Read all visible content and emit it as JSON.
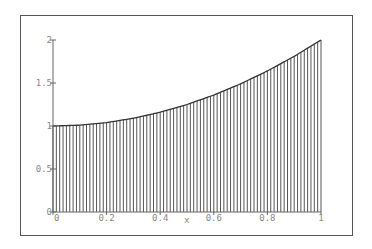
{
  "chart_data": {
    "type": "area",
    "title": "",
    "xlabel": "x",
    "ylabel": "",
    "function": "1 + x^2",
    "fill_style": "vertical-hatch",
    "x": [
      0,
      0.1,
      0.2,
      0.3,
      0.4,
      0.5,
      0.6,
      0.7,
      0.8,
      0.9,
      1.0
    ],
    "values": [
      1.0,
      1.01,
      1.04,
      1.09,
      1.16,
      1.25,
      1.36,
      1.49,
      1.64,
      1.81,
      2.0
    ],
    "xlim": [
      0,
      1
    ],
    "ylim": [
      0,
      2
    ],
    "xticks": [
      "0",
      "0.2",
      "0.4",
      "0.6",
      "0.8",
      "1"
    ],
    "yticks": [
      "0",
      "0.5",
      "1",
      "1.5",
      "2"
    ],
    "grid": false,
    "legend": null,
    "colors": {
      "line": "#333333",
      "hatch": "#555555",
      "axis": "#666666",
      "frame": "#555555"
    }
  }
}
